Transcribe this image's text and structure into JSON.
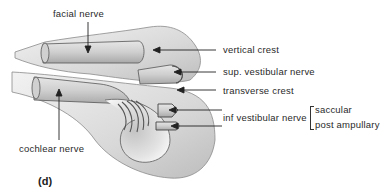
{
  "figure": {
    "panel_label": "(d)",
    "labels": {
      "facial_nerve": "facial nerve",
      "vertical_crest": "vertical crest",
      "sup_vestibular_nerve": "sup. vestibular nerve",
      "transverse_crest": "transverse  crest",
      "inf_vestibular_nerve": "inf vestibular nerve",
      "saccular": "saccular",
      "post_ampullary": "post ampullary",
      "cochlear_nerve": "cochlear nerve"
    }
  }
}
